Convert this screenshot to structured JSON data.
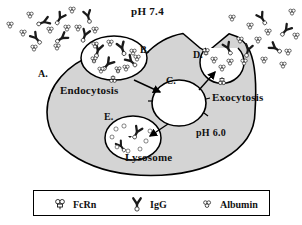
{
  "figure": {
    "ph_outside": "pH 7.4",
    "ph_inside": "pH 6.0",
    "cell_fill_color": "#d4d4d4",
    "outline_color": "#000000",
    "background_color": "#ffffff"
  },
  "labels": {
    "a": "A.",
    "b": "B.",
    "c": "C.",
    "d": "D.",
    "e": "E."
  },
  "regions": {
    "endocytosis": "Endocytosis",
    "exocytosis": "Exocytosis",
    "lysosome": "Lysosome"
  },
  "legend": {
    "items": [
      {
        "icon": "fcrn-icon",
        "label": "FcRn"
      },
      {
        "icon": "igg-icon",
        "label": "IgG"
      },
      {
        "icon": "albumin-icon",
        "label": "Albumin"
      }
    ]
  }
}
